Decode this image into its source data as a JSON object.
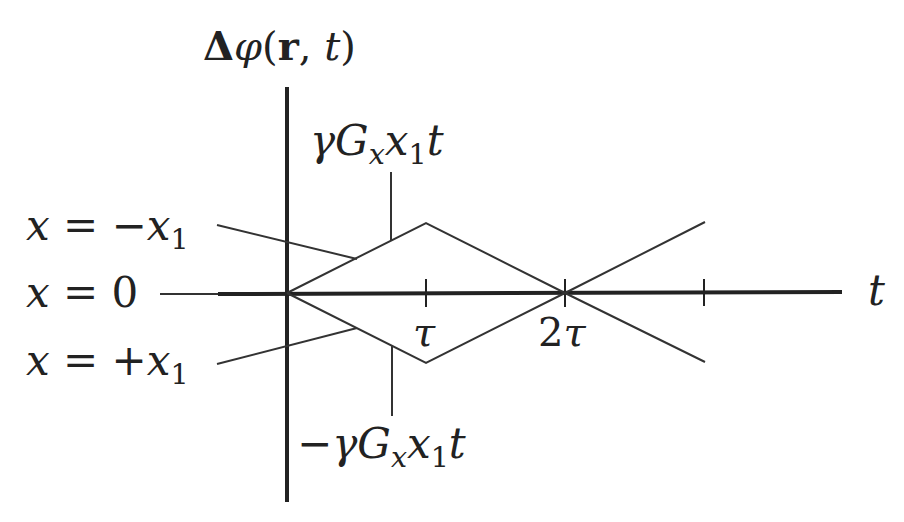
{
  "diagram": {
    "title": "Δφ(r, t)",
    "y_axis_label": {
      "delta": "Δ",
      "phi": "φ",
      "open": "(",
      "r": "r",
      "comma": ", ",
      "t": "t",
      "close": ")"
    },
    "x_axis_label": "t",
    "ticks": [
      {
        "label_num": "",
        "label_sym": "τ"
      },
      {
        "label_num": "2",
        "label_sym": "τ"
      },
      {
        "label_num": "",
        "label_sym": ""
      }
    ],
    "curves": [
      {
        "name": "x = -x1",
        "lhs": "x",
        "eq": " = ",
        "sign": "−",
        "var": "x",
        "sub": "1"
      },
      {
        "name": "x = 0",
        "lhs": "x",
        "eq": " = ",
        "sign": "",
        "var": "0",
        "sub": ""
      },
      {
        "name": "x = +x1",
        "lhs": "x",
        "eq": " = ",
        "sign": "+",
        "var": "x",
        "sub": "1"
      }
    ],
    "upper_annotation": {
      "sign": "",
      "gamma": "γ",
      "G": "G",
      "Gsub": "x",
      "x": "x",
      "xsub": "1",
      "t": "t"
    },
    "lower_annotation": {
      "sign": "−",
      "gamma": "γ",
      "G": "G",
      "Gsub": "x",
      "x": "x",
      "xsub": "1",
      "t": "t"
    },
    "colors": {
      "axis": "#222222",
      "line": "#333333"
    }
  }
}
